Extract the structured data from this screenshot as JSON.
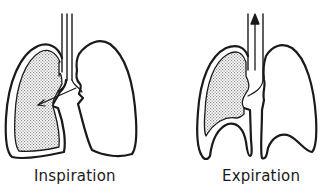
{
  "diagram": {
    "type": "respiration-lung-diagram",
    "panels": [
      {
        "id": "inspiration",
        "label": "Inspiration",
        "airflow": "into left lung (arrow pointing down into shaded lung)",
        "shaded_lung": "left",
        "elements": [
          "trachea",
          "left-lung-shaded",
          "right-lung-outline",
          "air-arrow-in"
        ]
      },
      {
        "id": "expiration",
        "label": "Expiration",
        "airflow": "out through trachea (arrow pointing up)",
        "shaded_lung": "left",
        "elements": [
          "trachea",
          "left-lung-shaded-compressed",
          "right-lung-outline",
          "air-arrow-out",
          "diaphragm-arches"
        ]
      }
    ],
    "colors": {
      "stroke": "#1a1a1a",
      "stipple": "#9a9a9a",
      "background": "#ffffff"
    }
  }
}
